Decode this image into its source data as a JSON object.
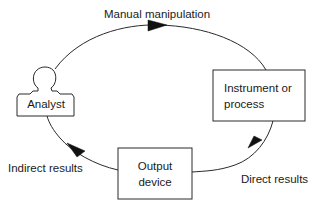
{
  "diagram": {
    "type": "cycle",
    "nodes": [
      {
        "id": "analyst",
        "label": "Analyst",
        "shape": "person"
      },
      {
        "id": "instrument",
        "label_lines": [
          "Instrument or",
          "process"
        ],
        "shape": "rectangle"
      },
      {
        "id": "output",
        "label_lines": [
          "Output",
          "device"
        ],
        "shape": "rectangle"
      }
    ],
    "edges": [
      {
        "from": "analyst",
        "to": "instrument",
        "label": "Manual manipulation"
      },
      {
        "from": "instrument",
        "to": "output",
        "label": "Direct results"
      },
      {
        "from": "output",
        "to": "analyst",
        "label": "Indirect results"
      }
    ]
  },
  "colors": {
    "line": "#2a2a2a",
    "arrowhead": "#111111",
    "background": "#ffffff"
  }
}
